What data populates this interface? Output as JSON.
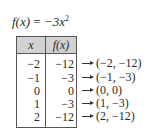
{
  "function": {
    "lhs": "f(x)",
    "equals": "=",
    "rhs_base": "−3x",
    "rhs_exponent": "2"
  },
  "table": {
    "headers": [
      "x",
      "f(x)"
    ],
    "header_background": "#d2d2d2",
    "rows": [
      {
        "x": "−2",
        "fx": "−12",
        "point": "(−2, −12)"
      },
      {
        "x": "−1",
        "fx": "−3",
        "point": "(−1, −3)"
      },
      {
        "x": "0",
        "fx": "0",
        "point": "(0, 0)"
      },
      {
        "x": "1",
        "fx": "−3",
        "point": "(1, −3)"
      },
      {
        "x": "2",
        "fx": "−12",
        "point": "(2, −12)"
      }
    ]
  },
  "arrow_icon": "right-arrow-icon"
}
